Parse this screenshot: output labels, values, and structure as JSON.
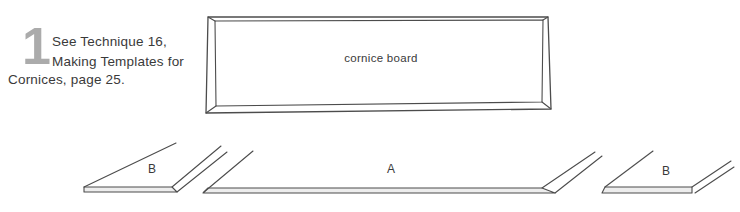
{
  "note": {
    "step_number": "1",
    "lines": [
      "See Technique 16,",
      "Making Templates for",
      "Cornices, page 25."
    ]
  },
  "diagram": {
    "cornice_board_label": "cornice board",
    "piece_left_label": "B",
    "piece_center_label": "A",
    "piece_right_label": "B"
  },
  "colors": {
    "line": "#4c4c4c",
    "step_number_gray": "#ababab",
    "text": "#3a3a3a",
    "edge_fill": "#ededed",
    "background": "#ffffff"
  }
}
